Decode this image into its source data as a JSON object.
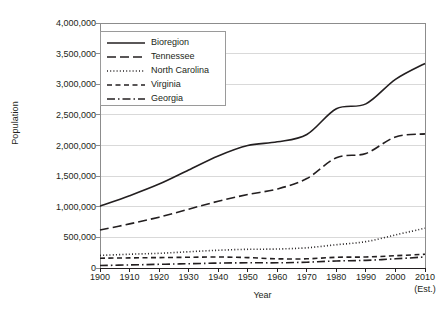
{
  "chart_data": {
    "type": "line",
    "title": "",
    "xlabel": "Year",
    "ylabel": "Population",
    "xlim": [
      1900,
      2010
    ],
    "ylim": [
      0,
      4000000
    ],
    "grid": true,
    "legend_position": "top-left-inside",
    "x": [
      1900,
      1910,
      1920,
      1930,
      1940,
      1950,
      1960,
      1970,
      1980,
      1990,
      2000,
      2010
    ],
    "x_tick_labels": [
      "1900",
      "1910",
      "1920",
      "1930",
      "1940",
      "1950",
      "1960",
      "1970",
      "1980",
      "1990",
      "2000",
      "2010"
    ],
    "x_tick_sublabels": [
      "",
      "",
      "",
      "",
      "",
      "",
      "",
      "",
      "",
      "",
      "",
      "(Est.)"
    ],
    "y_tick_labels": [
      "4,000,000",
      "3,500,000",
      "3,000,000",
      "2,500,000",
      "2,000,000",
      "1,500,000",
      "1,000,000",
      "500,000",
      "0"
    ],
    "y_tick_values": [
      4000000,
      3500000,
      3000000,
      2500000,
      2000000,
      1500000,
      1000000,
      500000,
      0
    ],
    "series": [
      {
        "name": "Bioregion",
        "dash": "solid",
        "color": "#231f20",
        "values": [
          1010000,
          1180000,
          1370000,
          1600000,
          1830000,
          2000000,
          2060000,
          2180000,
          2600000,
          2680000,
          3080000,
          3340000
        ]
      },
      {
        "name": "Tennessee",
        "dash": "long-dash",
        "color": "#231f20",
        "values": [
          620000,
          720000,
          830000,
          960000,
          1090000,
          1200000,
          1290000,
          1460000,
          1800000,
          1870000,
          2140000,
          2190000
        ]
      },
      {
        "name": "North Carolina",
        "dash": "dotted",
        "color": "#231f20",
        "values": [
          205000,
          225000,
          240000,
          265000,
          290000,
          305000,
          310000,
          330000,
          380000,
          430000,
          540000,
          650000
        ]
      },
      {
        "name": "Virginia",
        "dash": "dashed",
        "color": "#231f20",
        "values": [
          160000,
          165000,
          170000,
          175000,
          180000,
          170000,
          150000,
          150000,
          175000,
          180000,
          200000,
          225000
        ]
      },
      {
        "name": "Georgia",
        "dash": "dash-dot",
        "color": "#231f20",
        "values": [
          40000,
          50000,
          60000,
          70000,
          80000,
          85000,
          85000,
          95000,
          115000,
          125000,
          150000,
          180000
        ]
      }
    ]
  },
  "axes": {
    "y_title": "Population",
    "x_title": "Year"
  }
}
